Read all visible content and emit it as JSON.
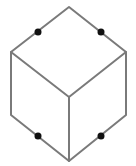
{
  "diagram": {
    "type": "isometric-cube",
    "colors": {
      "edge": "#7a7a7a",
      "dot": "#111111",
      "background": "#ffffff"
    },
    "vertices": {
      "top": [
        69,
        7
      ],
      "left_upper": [
        11,
        52
      ],
      "right_upper": [
        126,
        52
      ],
      "center": [
        69,
        97
      ],
      "left_lower": [
        11,
        115
      ],
      "right_lower": [
        126,
        115
      ],
      "bottom": [
        69,
        161
      ]
    },
    "dots": [
      {
        "name": "dot-top-left-edge",
        "x": 38,
        "y": 32
      },
      {
        "name": "dot-top-right-edge",
        "x": 101,
        "y": 32
      },
      {
        "name": "dot-bottom-left-edge",
        "x": 38,
        "y": 136
      },
      {
        "name": "dot-bottom-right-edge",
        "x": 101,
        "y": 136
      }
    ]
  }
}
